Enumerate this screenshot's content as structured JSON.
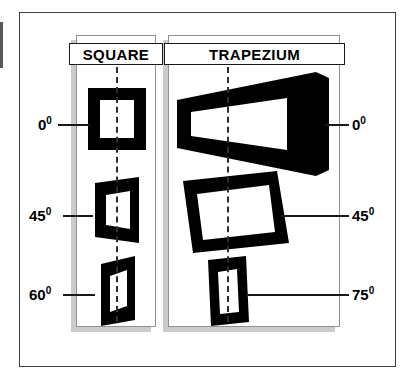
{
  "figure": {
    "background_color": "#ffffff",
    "frame_color": "#3c4043",
    "ink_color": "#000000",
    "panel_border_color": "#8d9194",
    "shadow_color": "#c9cbcc"
  },
  "panels": [
    {
      "id": "square",
      "title": "SQUARE"
    },
    {
      "id": "trapezium",
      "title": "TRAPEZIUM"
    }
  ],
  "left_axis_labels": [
    {
      "value": "0",
      "degree": "0",
      "text": "0"
    },
    {
      "value": "45",
      "degree": "0",
      "text": "45"
    },
    {
      "value": "60",
      "degree": "0",
      "text": "60"
    }
  ],
  "right_axis_labels": [
    {
      "value": "0",
      "degree": "0",
      "text": "0"
    },
    {
      "value": "45",
      "degree": "0",
      "text": "45"
    },
    {
      "value": "75",
      "degree": "0",
      "text": "75"
    }
  ],
  "degree_glyph": "0",
  "square_shapes": [
    {
      "angle": "0",
      "name": "square-at-0-degrees"
    },
    {
      "angle": "45",
      "name": "square-at-45-degrees"
    },
    {
      "angle": "60",
      "name": "square-at-60-degrees"
    }
  ],
  "trapezium_shapes": [
    {
      "angle": "0",
      "name": "trapezium-at-0-degrees"
    },
    {
      "angle": "45",
      "name": "trapezium-at-45-degrees"
    },
    {
      "angle": "75",
      "name": "trapezium-at-75-degrees"
    }
  ]
}
